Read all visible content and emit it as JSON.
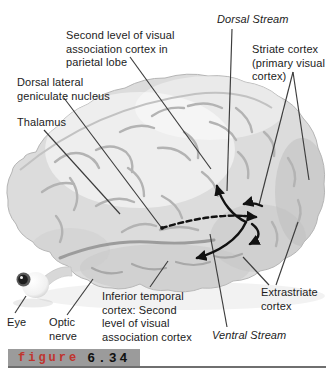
{
  "figure_caption": {
    "word": "figure",
    "number": "6.34"
  },
  "colors": {
    "figure_word": "#c0342e",
    "banner_bg": "#9b9b9b",
    "arrow": "#111111",
    "leader": "#3c3c3c",
    "brain_fill": "#dcdcdc"
  },
  "labels": {
    "second_level_parietal": {
      "text": "Second level of visual\nassociation cortex in\nparietal lobe"
    },
    "dorsal_stream": {
      "text": "Dorsal Stream"
    },
    "striate_cortex": {
      "text": "Striate cortex\n(primary visual\ncortex)"
    },
    "dorsal_lateral_geniculate": {
      "text": "Dorsal lateral\ngeniculate nucleus"
    },
    "thalamus": {
      "text": "Thalamus"
    },
    "eye": {
      "text": "Eye"
    },
    "optic_nerve": {
      "text": "Optic\nnerve"
    },
    "inferior_temporal": {
      "text": "Inferior temporal\ncortex: Second\nlevel of visual\nassociation cortex"
    },
    "ventral_stream": {
      "text": "Ventral Stream"
    },
    "extrastriate_cortex": {
      "text": "Extrastriate\ncortex"
    }
  }
}
